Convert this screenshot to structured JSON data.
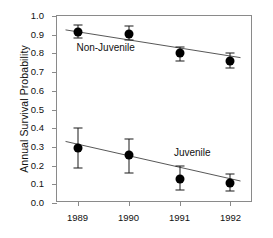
{
  "chart_data": {
    "type": "scatter",
    "title": "",
    "xlabel": "",
    "ylabel": "Annual Survival Probability",
    "categories": [
      "1989",
      "1990",
      "1991",
      "1992"
    ],
    "x": [
      1989,
      1990,
      1991,
      1992
    ],
    "ylim": [
      0.0,
      1.0
    ],
    "ytick_labels": [
      "0.0",
      "0.1",
      "0.2",
      "0.3",
      "0.4",
      "0.5",
      "0.6",
      "0.7",
      "0.8",
      "0.9",
      "1.0"
    ],
    "ytick_values": [
      0.0,
      0.1,
      0.2,
      0.3,
      0.4,
      0.5,
      0.6,
      0.7,
      0.8,
      0.9,
      1.0
    ],
    "grid": false,
    "legend": "inline-annotations",
    "marker": "filled-circle",
    "error_bars": "vertical-with-caps",
    "series": [
      {
        "name": "Non-Juvenile",
        "values": [
          0.915,
          0.905,
          0.8,
          0.76
        ],
        "err_low": [
          0.035,
          0.035,
          0.04,
          0.04
        ],
        "err_high": [
          0.035,
          0.04,
          0.035,
          0.04
        ],
        "fit_line": {
          "y_start": 0.925,
          "y_end": 0.775
        },
        "annotation": {
          "text": "Non-Juvenile",
          "x": 1989.55,
          "y": 0.835
        }
      },
      {
        "name": "Juvenile",
        "values": [
          0.295,
          0.255,
          0.128,
          0.105
        ],
        "err_low": [
          0.11,
          0.095,
          0.06,
          0.04
        ],
        "err_high": [
          0.105,
          0.085,
          0.072,
          0.05
        ],
        "fit_line": {
          "y_start": 0.322,
          "y_end": 0.108
        },
        "annotation": {
          "text": "Juvenile",
          "x": 1991.25,
          "y": 0.272
        }
      }
    ],
    "colors": {
      "marker": "#000000",
      "error_bar": "#1a1a1a",
      "fit_line": "#555555",
      "axis": "#8a8a8a",
      "text": "#111111",
      "background": "#ffffff"
    }
  }
}
